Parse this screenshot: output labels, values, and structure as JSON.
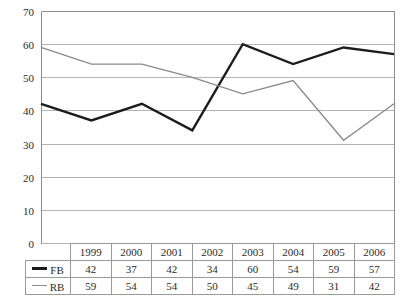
{
  "chart_data": {
    "type": "line",
    "title": "",
    "xlabel": "",
    "ylabel": "",
    "categories": [
      "1999",
      "2000",
      "2001",
      "2002",
      "2003",
      "2004",
      "2005",
      "2006"
    ],
    "series": [
      {
        "name": "FB",
        "color": "#1c1c1c",
        "line_width": 2.4,
        "values": [
          42,
          37,
          42,
          34,
          60,
          54,
          59,
          57
        ]
      },
      {
        "name": "RB",
        "color": "#8a8a8a",
        "line_width": 1.3,
        "values": [
          59,
          54,
          54,
          50,
          45,
          49,
          31,
          42
        ]
      }
    ],
    "ylim": [
      0,
      70
    ],
    "ytick_step": 10,
    "yticks": [
      "0",
      "10",
      "20",
      "30",
      "40",
      "50",
      "60",
      "70"
    ],
    "grid": true,
    "grid_color": "#b4b4b4",
    "legend_position": "table-row-header",
    "background": "#ffffff"
  },
  "table": {
    "corner_label": "",
    "header_row": [
      "1999",
      "2000",
      "2001",
      "2002",
      "2003",
      "2004",
      "2005",
      "2006"
    ],
    "rows": [
      {
        "label": "FB",
        "swatch_color": "#1c1c1c",
        "swatch_width": 3,
        "values": [
          "42",
          "37",
          "42",
          "34",
          "60",
          "54",
          "59",
          "57"
        ]
      },
      {
        "label": "RB",
        "swatch_color": "#8a8a8a",
        "swatch_width": 1.5,
        "values": [
          "59",
          "54",
          "54",
          "50",
          "45",
          "49",
          "31",
          "42"
        ]
      }
    ]
  },
  "layout": {
    "plot_left": 41,
    "plot_right": 394,
    "plot_top": 11,
    "plot_bottom": 243
  }
}
